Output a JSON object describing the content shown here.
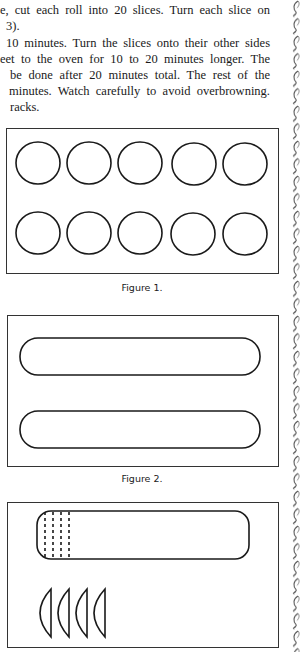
{
  "text_lines": [
    "e, cut each roll into 20 slices. Turn each slice on",
    "3).",
    "10 minutes. Turn the slices onto their other sides",
    "eet to the oven for 10 to 20 minutes longer. The",
    "be done after 20 minutes total. The rest of the",
    "minutes. Watch carefully to avoid overbrowning.",
    "racks."
  ],
  "figures": [
    {
      "caption": "Figure 1.",
      "description": "Ten circles (cookie slices) in two rows of five on a baking sheet"
    },
    {
      "caption": "Figure 2.",
      "description": "Two long rounded dough rolls on a baking sheet"
    },
    {
      "caption": "Figure 3.",
      "description": "One dough roll with dashed cut lines and four half-moon slices"
    }
  ],
  "decoration": {
    "name": "ornamental-vine-border",
    "color": "#555555"
  }
}
